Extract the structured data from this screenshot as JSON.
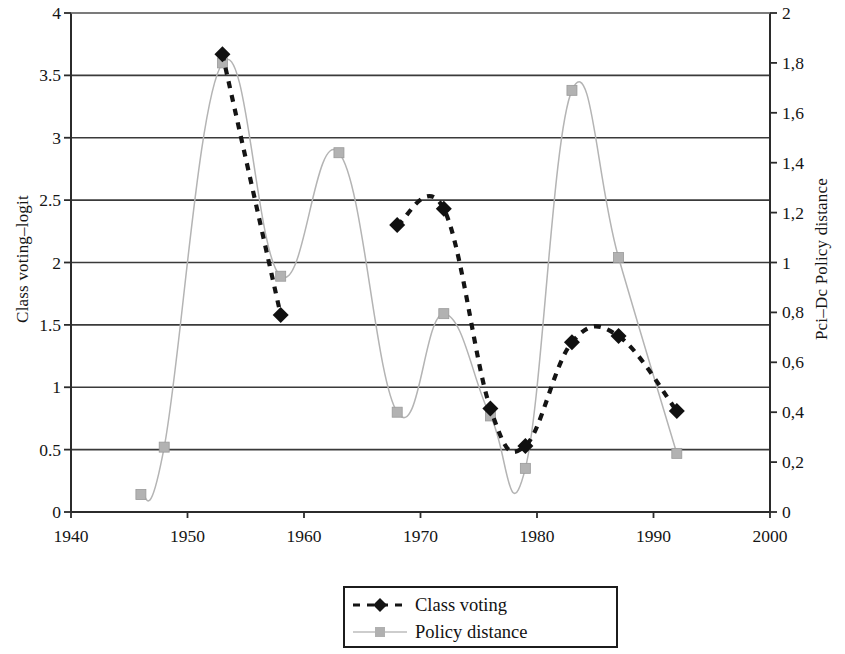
{
  "chart_data": {
    "type": "line",
    "title": "",
    "xlabel": "",
    "ylabel": "Class voting–logit",
    "ylabel_right": "Pci–Dc Policy distance",
    "xlim": [
      1940,
      2000
    ],
    "ylim": [
      0,
      4
    ],
    "ylim_right": [
      0,
      2
    ],
    "xticks": [
      "1940",
      "1950",
      "1960",
      "1970",
      "1980",
      "1990",
      "2000"
    ],
    "xtick_values": [
      1940,
      1950,
      1960,
      1970,
      1980,
      1990,
      2000
    ],
    "yticks": [
      "0",
      "0.5",
      "1",
      "1.5",
      "2",
      "2.5",
      "3",
      "3.5",
      "4"
    ],
    "ytick_values": [
      0,
      0.5,
      1,
      1.5,
      2,
      2.5,
      3,
      3.5,
      4
    ],
    "yticks_right": [
      "0",
      "0,2",
      "0,4",
      "0,6",
      "0,8",
      "1",
      "1,2",
      "1,4",
      "1,6",
      "1,8",
      "2"
    ],
    "ytick_values_right": [
      0,
      0.2,
      0.4,
      0.6,
      0.8,
      1.0,
      1.2,
      1.4,
      1.6,
      1.8,
      2.0
    ],
    "grid": "horizontal",
    "legend_position": "bottom-center",
    "series": [
      {
        "name": "Class voting",
        "axis": "left",
        "color": "#141414",
        "style": "dashed",
        "marker": "diamond",
        "x": [
          1953,
          1958,
          1968,
          1972,
          1976,
          1979,
          1983,
          1987,
          1992
        ],
        "values": [
          3.67,
          1.58,
          2.3,
          2.43,
          0.83,
          0.53,
          1.36,
          1.41,
          0.81
        ]
      },
      {
        "name": "Policy distance",
        "axis": "right",
        "color": "#b4b4b4",
        "style": "solid",
        "marker": "square",
        "x": [
          1946,
          1948,
          1953,
          1958,
          1963,
          1968,
          1972,
          1976,
          1979,
          1983,
          1987,
          1992
        ],
        "values": [
          0.07,
          0.26,
          1.8,
          0.945,
          1.44,
          0.4,
          0.795,
          0.385,
          0.175,
          1.69,
          1.02,
          0.235
        ],
        "values_left_scale": [
          0.14,
          0.52,
          3.6,
          1.89,
          2.88,
          0.8,
          1.59,
          0.77,
          0.35,
          3.37,
          2.04,
          0.47
        ]
      }
    ]
  },
  "legend": {
    "items": [
      {
        "label": "Class voting"
      },
      {
        "label": "Policy distance"
      }
    ]
  }
}
